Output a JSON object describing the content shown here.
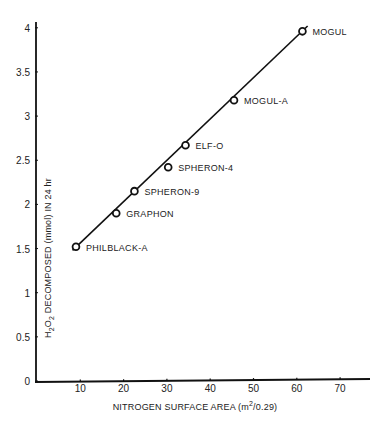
{
  "chart_data": {
    "type": "scatter",
    "title": "",
    "xlabel": "NITROGEN SURFACE AREA (m²/0.29)",
    "xlabel_parts": {
      "pre": "NITROGEN SURFACE AREA (m",
      "sup": "2",
      "post": "/0.29)"
    },
    "ylabel": "H₂O₂ DECOMPOSED (mmol) IN 24 hr",
    "ylabel_parts": {
      "pre": "H",
      "sub1": "2",
      "mid": "O",
      "sub2": "2",
      "post": " DECOMPOSED (mmol) IN 24 hr"
    },
    "xlim": [
      0,
      75
    ],
    "ylim": [
      0,
      4.1
    ],
    "x_ticks": [
      10,
      20,
      30,
      40,
      50,
      60,
      70
    ],
    "y_ticks": [
      0,
      0.5,
      1,
      1.5,
      2,
      2.5,
      3,
      3.5,
      4
    ],
    "y_tick_labels": [
      "0",
      "0.5",
      "1",
      "1.5",
      "2",
      "2.5",
      "3",
      "3.5",
      "4"
    ],
    "grid": false,
    "legend": "none",
    "points": [
      {
        "label": "PHILBLACK-A",
        "x": 9,
        "y": 1.52
      },
      {
        "label": "GRAPHON",
        "x": 18.3,
        "y": 1.9
      },
      {
        "label": "SPHERON-9",
        "x": 22.5,
        "y": 2.15
      },
      {
        "label": "SPHERON-4",
        "x": 30.3,
        "y": 2.42
      },
      {
        "label": "ELF-O",
        "x": 34.3,
        "y": 2.67
      },
      {
        "label": "MOGUL-A",
        "x": 45.5,
        "y": 3.18
      },
      {
        "label": "MOGUL",
        "x": 61.3,
        "y": 3.96
      }
    ],
    "fit_line": {
      "x0": 8.2,
      "y0": 1.48,
      "x1": 62.5,
      "y1": 4.02
    }
  }
}
